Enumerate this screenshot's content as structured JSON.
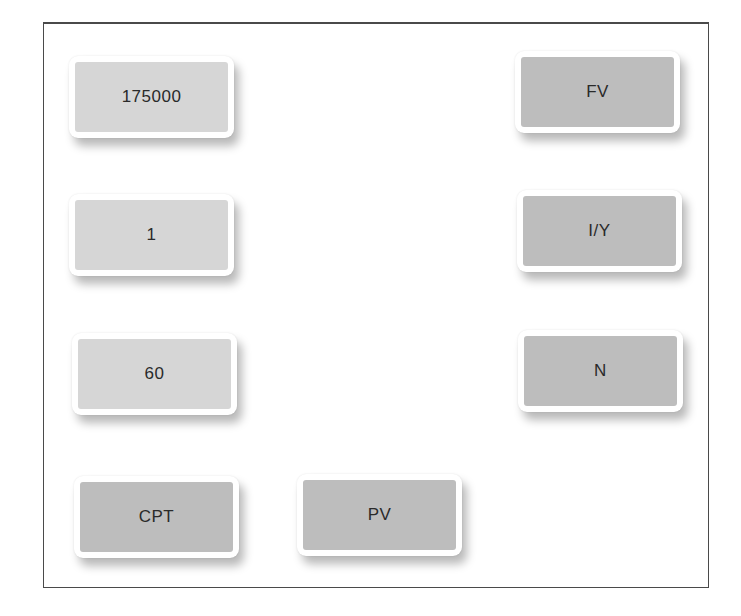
{
  "colors": {
    "value_key_fill": "#d6d6d6",
    "operation_key_fill": "#bdbdbd",
    "frame_border": "#4a4a4a",
    "text": "#2a2a2a"
  },
  "value_keys": [
    {
      "label": "175000"
    },
    {
      "label": "1"
    },
    {
      "label": "60"
    }
  ],
  "operation_keys": [
    {
      "label": "FV"
    },
    {
      "label": "I/Y"
    },
    {
      "label": "N"
    },
    {
      "label": "CPT"
    },
    {
      "label": "PV"
    }
  ]
}
